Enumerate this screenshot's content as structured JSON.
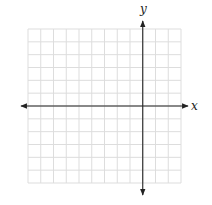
{
  "diagram": {
    "type": "coordinate-plane",
    "labels": {
      "x_axis": "x",
      "y_axis": "y"
    },
    "grid": {
      "columns": 12,
      "rows": 12,
      "columns_left_of_y_axis": 9,
      "columns_right_of_y_axis": 3,
      "rows_above_x_axis": 6,
      "rows_below_x_axis": 6
    },
    "colors": {
      "grid_line": "#dddddd",
      "axis_line": "#222222",
      "background": "#ffffff"
    }
  }
}
